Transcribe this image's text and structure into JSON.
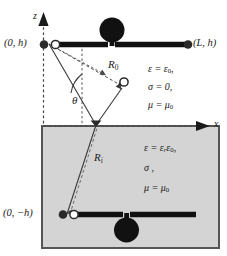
{
  "figure": {
    "domain_note": "two-layer half-space dipole antenna geometry",
    "axes": {
      "z_label": "z",
      "x_label": "x"
    },
    "points": {
      "top_left": "(0, h)",
      "top_right": "(L, h)",
      "bottom_left": "(0, −h)"
    },
    "rays": {
      "direct": "R",
      "direct_sub": "0",
      "image": "R",
      "image_sub": "i"
    },
    "angle": {
      "symbol": "θ"
    },
    "upper_medium": {
      "permittivity": "ε = ε",
      "permittivity_sub": "0",
      "permittivity_tail": ",",
      "conductivity": "σ = 0,",
      "permeability": "μ = μ",
      "permeability_sub": "0"
    },
    "lower_medium": {
      "permittivity": "ε = ε",
      "permittivity_sub_r": "r",
      "permittivity_mid": "ε",
      "permittivity_sub_0": "0",
      "permittivity_tail": ",",
      "conductivity": "σ ,",
      "permeability": "μ = μ",
      "permeability_sub": "0"
    },
    "colors": {
      "ink": "#1a1a1a",
      "ground_fill": "#d4d4d4",
      "ground_border": "#555555",
      "dashed": "#444444",
      "ray_solid": "#3a3a3a"
    }
  }
}
